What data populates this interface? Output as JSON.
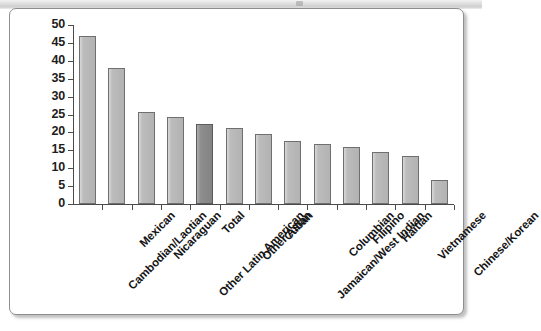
{
  "panel": {
    "background_color": "#ffffff",
    "border_color": "#8e8e8e"
  },
  "chart_data": {
    "type": "bar",
    "title": "",
    "subtitle": "",
    "xlabel": "",
    "ylabel": "",
    "ylim": [
      0,
      50
    ],
    "ytick_step": 5,
    "ytick_labels": [
      "0",
      "5",
      "10",
      "15",
      "20",
      "25",
      "30",
      "35",
      "40",
      "45",
      "50"
    ],
    "grid": false,
    "legend": false,
    "legend_position": "none",
    "bar_color": "#bcbcbc",
    "bar_edge_color": "#6f6f6f",
    "highlight_color": "#8d8d8d",
    "highlight_category": "Total",
    "categories": [
      "Cambodian/Laotian",
      "Mexican",
      "Nicaraguan",
      "Other Latin American",
      "Total",
      "Other Asian",
      "Cuban",
      "Jamaican/West Indian",
      "Columbian",
      "Filipino",
      "Haitian",
      "Vietnamese",
      "Chinese/Korean"
    ],
    "values": [
      46.8,
      37.9,
      25.7,
      24.2,
      22.4,
      21.2,
      19.5,
      17.6,
      16.7,
      16.0,
      14.4,
      13.4,
      6.6
    ]
  }
}
